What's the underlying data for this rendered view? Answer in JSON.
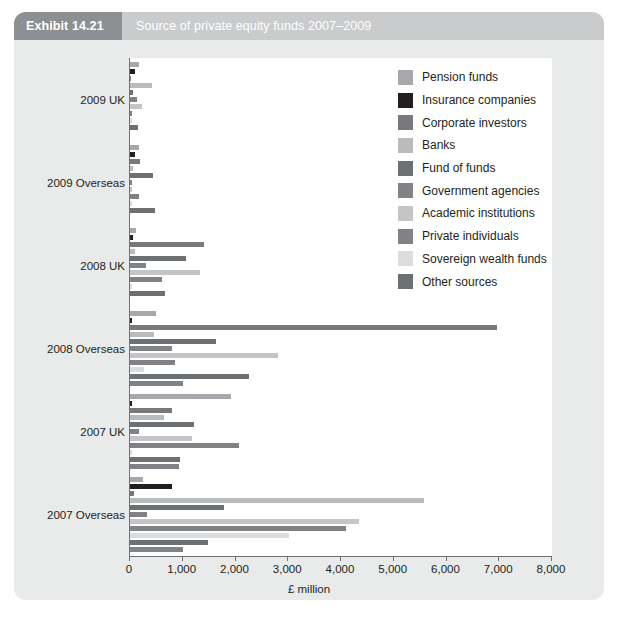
{
  "header": {
    "exhibit_tag": "Exhibit 14.21",
    "title": "Source of private equity funds 2007–2009",
    "tag_bg": "#8d9093",
    "bar_bg": "#c9cbcc"
  },
  "chart_data": {
    "type": "bar",
    "orientation": "horizontal",
    "title": "Source of private equity funds 2007–2009",
    "xlabel": "£ million",
    "ylabel": "",
    "xlim": [
      0,
      8000
    ],
    "xticks": [
      0,
      1000,
      2000,
      3000,
      4000,
      5000,
      6000,
      7000,
      8000
    ],
    "xtick_labels": [
      "0",
      "1,000",
      "2,000",
      "3,000",
      "4,000",
      "5,000",
      "6,000",
      "7,000",
      "8,000"
    ],
    "grid": false,
    "legend_position": "upper right",
    "categories": [
      "2009 UK",
      "2009 Overseas",
      "2008 UK",
      "2008 Overseas",
      "2007 UK",
      "2007 Overseas"
    ],
    "series": [
      {
        "name": "Pension funds",
        "color": "#a6a8ab",
        "values": [
          180,
          170,
          120,
          490,
          1910,
          240
        ]
      },
      {
        "name": "Insurance companies",
        "color": "#231f20",
        "values": [
          95,
          95,
          50,
          30,
          30,
          790
        ]
      },
      {
        "name": "Corporate investors",
        "color": "#77797c",
        "values": [
          20,
          190,
          1400,
          6950,
          790,
          80
        ]
      },
      {
        "name": "Banks",
        "color": "#b9bbbd",
        "values": [
          410,
          60,
          100,
          460,
          640,
          5570
        ]
      },
      {
        "name": "Fund of funds",
        "color": "#6d7073",
        "values": [
          60,
          430,
          1070,
          1630,
          1220,
          1790
        ]
      },
      {
        "name": "Government agencies",
        "color": "#808285",
        "values": [
          130,
          30,
          310,
          790,
          170,
          330
        ]
      },
      {
        "name": "Academic institutions",
        "color": "#c3c5c7",
        "values": [
          230,
          30,
          1330,
          2800,
          1180,
          4350
        ]
      },
      {
        "name": "Private individuals",
        "color": "#808285",
        "values": [
          40,
          180,
          610,
          850,
          2070,
          4090
        ]
      },
      {
        "name": "Sovereign wealth funds",
        "color": "#dcdddf",
        "values": [
          30,
          40,
          30,
          260,
          30,
          3020
        ]
      },
      {
        "name": "Other sources",
        "color": "#6d7073",
        "values": [
          160,
          480,
          660,
          2250,
          950,
          1470
        ]
      }
    ],
    "trailing_series": {
      "name": "Other sources",
      "values": [
        null,
        null,
        null,
        1000,
        930,
        1000
      ]
    }
  },
  "legend": {
    "items": [
      {
        "label": "Pension funds",
        "color": "#a6a8ab"
      },
      {
        "label": "Insurance companies",
        "color": "#231f20"
      },
      {
        "label": "Corporate investors",
        "color": "#77797c"
      },
      {
        "label": "Banks",
        "color": "#b9bbbd"
      },
      {
        "label": "Fund of funds",
        "color": "#6d7073"
      },
      {
        "label": "Government agencies",
        "color": "#808285"
      },
      {
        "label": "Academic institutions",
        "color": "#c3c5c7"
      },
      {
        "label": "Private individuals",
        "color": "#808285"
      },
      {
        "label": "Sovereign wealth funds",
        "color": "#dcdddf"
      },
      {
        "label": "Other sources",
        "color": "#6d7073"
      }
    ]
  }
}
